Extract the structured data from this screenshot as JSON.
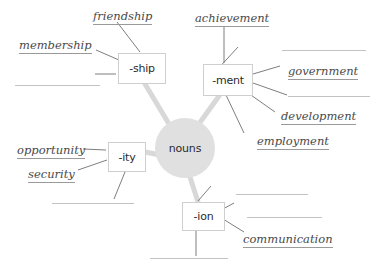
{
  "diagram": {
    "center": {
      "label": "nouns",
      "x": 155,
      "y": 118,
      "size": 60,
      "fill": "#e0e0e0"
    },
    "branch_color": "#d8d8d8",
    "leader_color": "#6f6f6f",
    "box_border": "#cfcfcf",
    "word_color": "#4a4a4a",
    "blank_color": "#c3c3c3",
    "nodes": [
      {
        "id": "ship",
        "label": "-ship",
        "x": 118,
        "y": 53,
        "w": 46,
        "h": 29
      },
      {
        "id": "ment",
        "label": "-ment",
        "x": 203,
        "y": 64,
        "w": 48,
        "h": 30
      },
      {
        "id": "ity",
        "label": "-ity",
        "x": 108,
        "y": 142,
        "w": 36,
        "h": 28
      },
      {
        "id": "ion",
        "label": "-ion",
        "x": 182,
        "y": 202,
        "w": 41,
        "h": 27
      }
    ],
    "words": [
      {
        "text": "friendship",
        "x": 93,
        "y": 10,
        "node": "ship"
      },
      {
        "text": "membership",
        "x": 19,
        "y": 39,
        "node": "ship"
      },
      {
        "text": "achievement",
        "x": 195,
        "y": 12,
        "node": "ment"
      },
      {
        "text": "government",
        "x": 288,
        "y": 65,
        "node": "ment"
      },
      {
        "text": "development",
        "x": 281,
        "y": 110,
        "node": "ment"
      },
      {
        "text": "employment",
        "x": 257,
        "y": 135,
        "node": "ment"
      },
      {
        "text": "opportunity",
        "x": 17,
        "y": 144,
        "node": "ity"
      },
      {
        "text": "security",
        "x": 28,
        "y": 168,
        "node": "ity"
      },
      {
        "text": "communication",
        "x": 243,
        "y": 233,
        "node": "ion"
      }
    ],
    "blanks": [
      {
        "id": "blank-ship-1",
        "x": 15,
        "y": 85,
        "w": 85,
        "node": "ship"
      },
      {
        "id": "blank-ment-1",
        "x": 282,
        "y": 50,
        "w": 84,
        "node": "ment"
      },
      {
        "id": "blank-ment-2",
        "x": 288,
        "y": 96,
        "w": 82,
        "node": "ment"
      },
      {
        "id": "blank-ity-1",
        "x": 52,
        "y": 203,
        "w": 82,
        "node": "ity"
      },
      {
        "id": "blank-ion-1",
        "x": 236,
        "y": 194,
        "w": 72,
        "node": "ion"
      },
      {
        "id": "blank-ion-2",
        "x": 247,
        "y": 217,
        "w": 75,
        "node": "ion"
      },
      {
        "id": "blank-ion-3",
        "x": 150,
        "y": 258,
        "w": 78,
        "node": "ion"
      }
    ],
    "branches": [
      {
        "from": "center",
        "to": "ship",
        "x1": 172,
        "y1": 129,
        "x2": 145,
        "y2": 84
      },
      {
        "from": "center",
        "to": "ment",
        "x1": 196,
        "y1": 128,
        "x2": 219,
        "y2": 96
      },
      {
        "from": "center",
        "to": "ity",
        "x1": 160,
        "y1": 155,
        "x2": 145,
        "y2": 152
      },
      {
        "from": "center",
        "to": "ion",
        "x1": 190,
        "y1": 177,
        "x2": 198,
        "y2": 202
      }
    ],
    "leaders": [
      {
        "node": "ship",
        "x1": 140,
        "y1": 52,
        "x2": 117,
        "y2": 22
      },
      {
        "node": "ship",
        "x1": 119,
        "y1": 60,
        "x2": 96,
        "y2": 50
      },
      {
        "node": "ship",
        "x1": 116,
        "y1": 74,
        "x2": 95,
        "y2": 74
      },
      {
        "node": "ment",
        "x1": 224,
        "y1": 63,
        "x2": 224,
        "y2": 26
      },
      {
        "node": "ment",
        "x1": 215,
        "y1": 72,
        "x2": 238,
        "y2": 47
      },
      {
        "node": "ment",
        "x1": 253,
        "y1": 74,
        "x2": 280,
        "y2": 66
      },
      {
        "node": "ment",
        "x1": 253,
        "y1": 83,
        "x2": 287,
        "y2": 95
      },
      {
        "node": "ment",
        "x1": 248,
        "y1": 93,
        "x2": 275,
        "y2": 112
      },
      {
        "node": "ment",
        "x1": 226,
        "y1": 95,
        "x2": 244,
        "y2": 133
      },
      {
        "node": "ity",
        "x1": 106,
        "y1": 150,
        "x2": 83,
        "y2": 149
      },
      {
        "node": "ity",
        "x1": 107,
        "y1": 160,
        "x2": 78,
        "y2": 170
      },
      {
        "node": "ity",
        "x1": 125,
        "y1": 172,
        "x2": 114,
        "y2": 199
      },
      {
        "node": "ion",
        "x1": 198,
        "y1": 201,
        "x2": 211,
        "y2": 186
      },
      {
        "node": "ion",
        "x1": 223,
        "y1": 209,
        "x2": 234,
        "y2": 203
      },
      {
        "node": "ion",
        "x1": 223,
        "y1": 219,
        "x2": 244,
        "y2": 232
      },
      {
        "node": "ion",
        "x1": 196,
        "y1": 230,
        "x2": 196,
        "y2": 256
      }
    ]
  }
}
